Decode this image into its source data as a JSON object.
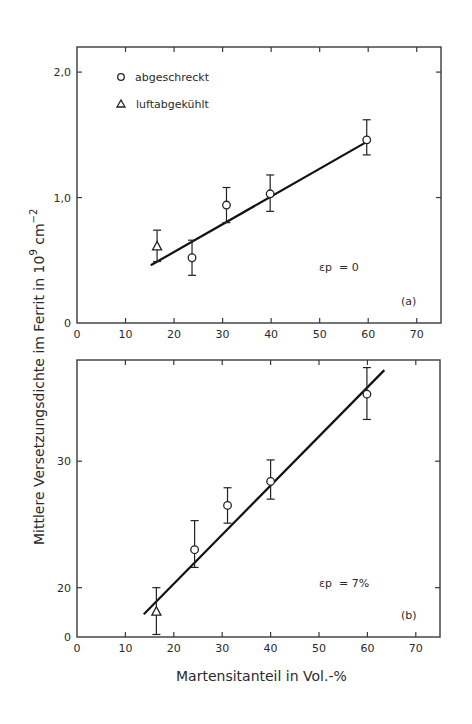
{
  "figure": {
    "ylabel": "Mittlere Versetzungsdichte im Ferrit in 10",
    "ylabel_exp": "9",
    "ylabel_unit": " cm",
    "ylabel_unit_exp": "−2",
    "xlabel": "Martensitanteil in Vol.-%"
  },
  "legend": {
    "items": [
      {
        "symbol": "circle",
        "label": "abgeschreckt"
      },
      {
        "symbol": "triangle",
        "label": "luftabgekühlt"
      }
    ]
  },
  "panels": [
    {
      "id": "a",
      "panel_label": "(a)",
      "annotation": "εp  = 0",
      "y_ticks": [
        {
          "value": 0,
          "label": "0"
        },
        {
          "value": 1.0,
          "label": "1,0"
        },
        {
          "value": 2.0,
          "label": "2,0"
        }
      ],
      "x_ticks": [
        "0",
        "10",
        "20",
        "30",
        "40",
        "50",
        "60",
        "70"
      ]
    },
    {
      "id": "b",
      "panel_label": "(b)",
      "annotation": "εp  = 7%",
      "y_ticks": [
        {
          "value": 16.1,
          "label": "0"
        },
        {
          "value": 20,
          "label": "20"
        },
        {
          "value": 30,
          "label": "30"
        }
      ],
      "x_ticks": [
        "0",
        "10",
        "20",
        "30",
        "40",
        "50",
        "60",
        "70"
      ]
    }
  ],
  "chart_data": [
    {
      "type": "scatter",
      "title": "(a) εp = 0",
      "xlabel": "Martensitanteil in Vol.-%",
      "ylabel": "Mittlere Versetzungsdichte im Ferrit in 10^9 cm^-2",
      "xlim": [
        0,
        75
      ],
      "ylim": [
        0,
        2.2
      ],
      "x_ticks": [
        0,
        10,
        20,
        30,
        40,
        50,
        60,
        70
      ],
      "y_ticks": [
        0,
        1.0,
        2.0
      ],
      "grid": false,
      "legend_position": "upper left",
      "series": [
        {
          "name": "abgeschreckt",
          "marker": "circle",
          "x": [
            23.7,
            30.8,
            39.8,
            59.7
          ],
          "y": [
            0.52,
            0.94,
            1.03,
            1.46
          ],
          "err_low": [
            0.38,
            0.8,
            0.89,
            1.34
          ],
          "err_high": [
            0.66,
            1.08,
            1.18,
            1.62
          ]
        },
        {
          "name": "luftabgekühlt",
          "marker": "triangle",
          "x": [
            16.5
          ],
          "y": [
            0.61
          ],
          "err_low": [
            0.49
          ],
          "err_high": [
            0.74
          ]
        },
        {
          "name": "fit",
          "type": "line",
          "x": [
            15.2,
            59.5
          ],
          "y": [
            0.46,
            1.44
          ]
        }
      ],
      "annotations": [
        "εp = 0",
        "(a)"
      ]
    },
    {
      "type": "scatter",
      "title": "(b) εp = 7%",
      "xlabel": "Martensitanteil in Vol.-%",
      "ylabel": "Mittlere Versetzungsdichte im Ferrit in 10^9 cm^-2",
      "xlim": [
        0,
        75
      ],
      "ylim": [
        16.1,
        38
      ],
      "y_axis_break": "bottom labeled 0",
      "x_ticks": [
        0,
        10,
        20,
        30,
        40,
        50,
        60,
        70
      ],
      "y_ticks": [
        20,
        30
      ],
      "grid": false,
      "series": [
        {
          "name": "abgeschreckt",
          "marker": "circle",
          "x": [
            24.3,
            31.1,
            40.0,
            59.9
          ],
          "y": [
            23.0,
            26.5,
            28.4,
            35.3
          ],
          "err_low": [
            21.6,
            25.1,
            27.0,
            33.3
          ],
          "err_high": [
            25.3,
            27.9,
            30.1,
            37.4
          ]
        },
        {
          "name": "luftabgekühlt",
          "marker": "triangle",
          "x": [
            16.4
          ],
          "y": [
            18.1
          ],
          "err_low": [
            16.3
          ],
          "err_high": [
            20.0
          ]
        },
        {
          "name": "fit",
          "type": "line",
          "x": [
            13.8,
            63.5
          ],
          "y": [
            17.9,
            37.2
          ]
        }
      ],
      "annotations": [
        "εp = 7%",
        "(b)"
      ]
    }
  ]
}
